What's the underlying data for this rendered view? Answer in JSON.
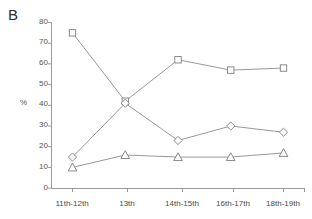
{
  "panel": {
    "label": "B"
  },
  "axes": {
    "y_title": "%",
    "y_ticks": [
      "0",
      "10",
      "20",
      "30",
      "40",
      "50",
      "60",
      "70",
      "80"
    ],
    "x_ticks": [
      "11th-12th",
      "13th",
      "14th-15th",
      "16th-17th",
      "18th-19th"
    ]
  },
  "colors": {
    "axis": "#9a9a9a",
    "line": "#8c8c8c",
    "marker_stroke": "#7d7d7d",
    "marker_fill": "#ffffff",
    "text": "#555555",
    "panel_label": "#2b2b2b",
    "background": "#ffffff"
  },
  "chart_data": {
    "type": "line",
    "title": "B",
    "xlabel": "",
    "ylabel": "%",
    "ylim": [
      0,
      80
    ],
    "ytick_step": 10,
    "grid": false,
    "legend": "none",
    "categories": [
      "11th-12th",
      "13th",
      "14th-15th",
      "16th-17th",
      "18th-19th"
    ],
    "series": [
      {
        "name": "series-square",
        "marker": "square",
        "values": [
          75,
          42,
          62,
          57,
          58
        ]
      },
      {
        "name": "series-diamond",
        "marker": "diamond",
        "values": [
          15,
          41,
          23,
          30,
          27
        ]
      },
      {
        "name": "series-triangle",
        "marker": "triangle",
        "values": [
          10,
          16,
          15,
          15,
          17
        ]
      }
    ]
  }
}
